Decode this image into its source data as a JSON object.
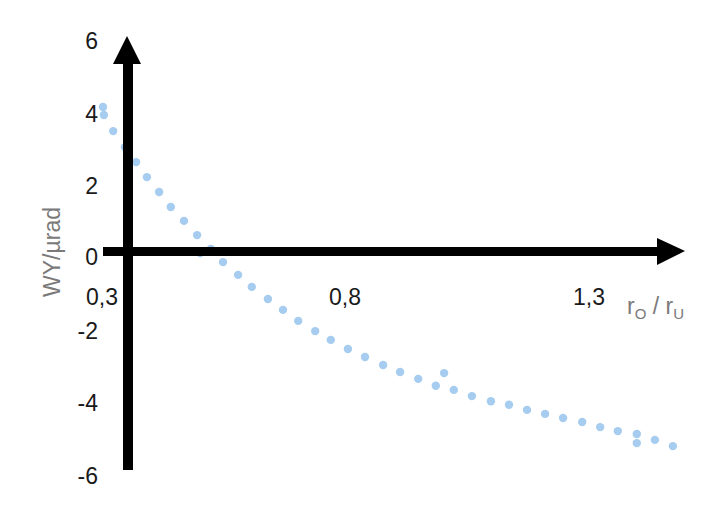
{
  "chart_data": {
    "type": "scatter",
    "title": "",
    "xlabel": "rO / rU",
    "xlabel_parts": {
      "r1": "r",
      "sub1": "O",
      "sep": " / ",
      "r2": "r",
      "sub2": "U"
    },
    "ylabel": "WY/µrad",
    "x_ticks": [
      "0,3",
      "0,8",
      "1,3"
    ],
    "x_tick_values": [
      0.3,
      0.8,
      1.3
    ],
    "y_ticks": [
      "6",
      "4",
      "2",
      "0",
      "-2",
      "-4",
      "-6"
    ],
    "y_tick_values": [
      6,
      4,
      2,
      0,
      -2,
      -4,
      -6
    ],
    "xlim": [
      0.3,
      1.5
    ],
    "ylim": [
      -6,
      6
    ],
    "grid": false,
    "legend": null,
    "colors": {
      "points": "#a6ccf0",
      "axes": "#000000",
      "axis_title": "#7a7a7a",
      "ticks": "#1a1a1a"
    },
    "series": [
      {
        "name": "WY",
        "points": [
          [
            0.304,
            4.11
          ],
          [
            0.306,
            3.89
          ],
          [
            0.325,
            3.45
          ],
          [
            0.349,
            3.01
          ],
          [
            0.372,
            2.6
          ],
          [
            0.394,
            2.19
          ],
          [
            0.419,
            1.78
          ],
          [
            0.443,
            1.37
          ],
          [
            0.47,
            0.99
          ],
          [
            0.497,
            0.6
          ],
          [
            0.503,
            0.11
          ],
          [
            0.525,
            0.22
          ],
          [
            0.55,
            -0.14
          ],
          [
            0.581,
            -0.49
          ],
          [
            0.609,
            -0.82
          ],
          [
            0.642,
            -1.15
          ],
          [
            0.673,
            -1.45
          ],
          [
            0.704,
            -1.75
          ],
          [
            0.739,
            -2.03
          ],
          [
            0.771,
            -2.27
          ],
          [
            0.806,
            -2.52
          ],
          [
            0.841,
            -2.74
          ],
          [
            0.878,
            -2.96
          ],
          [
            0.913,
            -3.15
          ],
          [
            0.95,
            -3.34
          ],
          [
            0.986,
            -3.53
          ],
          [
            1.003,
            -3.18
          ],
          [
            1.023,
            -3.64
          ],
          [
            1.06,
            -3.81
          ],
          [
            1.099,
            -3.95
          ],
          [
            1.136,
            -4.05
          ],
          [
            1.173,
            -4.19
          ],
          [
            1.21,
            -4.3
          ],
          [
            1.247,
            -4.41
          ],
          [
            1.286,
            -4.52
          ],
          [
            1.323,
            -4.66
          ],
          [
            1.359,
            -4.77
          ],
          [
            1.398,
            -4.85
          ],
          [
            1.398,
            -5.1
          ],
          [
            1.435,
            -5.01
          ],
          [
            1.472,
            -5.18
          ]
        ]
      }
    ]
  }
}
